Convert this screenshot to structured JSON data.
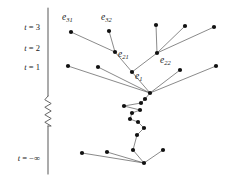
{
  "figure": {
    "background_color": "#ffffff",
    "width": 226,
    "height": 182
  },
  "axis": {
    "name": "time-axis",
    "color": "#666666",
    "x": 48,
    "top_y": 8,
    "bottom_y": 174,
    "break_symbol": "zigzag",
    "break_from_y": 96,
    "break_to_y": 126,
    "ticks": [
      {
        "id": "t3",
        "text": "t = 3",
        "var": "t",
        "rel": "=",
        "value": "3",
        "x": 40,
        "y": 30
      },
      {
        "id": "t2",
        "text": "t = 2",
        "var": "t",
        "rel": "=",
        "value": "2",
        "x": 40,
        "y": 51
      },
      {
        "id": "t1",
        "text": "t = 1",
        "var": "t",
        "rel": "=",
        "value": "1",
        "x": 40,
        "y": 70
      },
      {
        "id": "tneginf",
        "text": "t = -∞",
        "var": "t",
        "rel": "=",
        "value": "−∞",
        "x": 40,
        "y": 161
      }
    ]
  },
  "graph": {
    "type": "tree",
    "node_color": "#111111",
    "edge_color": "#3a3a3a",
    "node_radius": 2.1,
    "nodes": [
      {
        "id": "n_e31",
        "x": 71,
        "y": 32,
        "label": null
      },
      {
        "id": "n_e32",
        "x": 109,
        "y": 31,
        "label": null
      },
      {
        "id": "n_t2a",
        "x": 156,
        "y": 25,
        "label": null
      },
      {
        "id": "n_t2b",
        "x": 185,
        "y": 26,
        "label": null
      },
      {
        "id": "n_t2c",
        "x": 214,
        "y": 27,
        "label": null
      },
      {
        "id": "n_e21",
        "x": 115,
        "y": 52,
        "label": "e21"
      },
      {
        "id": "n_e22",
        "x": 157,
        "y": 53,
        "label": "e22"
      },
      {
        "id": "n_e1",
        "x": 132,
        "y": 72,
        "label": "e1"
      },
      {
        "id": "n_l1",
        "x": 68,
        "y": 66,
        "label": null
      },
      {
        "id": "n_l2",
        "x": 98,
        "y": 67,
        "label": null
      },
      {
        "id": "n_r1",
        "x": 180,
        "y": 70,
        "label": null
      },
      {
        "id": "n_r2",
        "x": 216,
        "y": 66,
        "label": null
      },
      {
        "id": "n_c0",
        "x": 150,
        "y": 93,
        "label": null
      },
      {
        "id": "n_c1",
        "x": 145,
        "y": 99,
        "label": null
      },
      {
        "id": "n_c2",
        "x": 141,
        "y": 103,
        "label": null
      },
      {
        "id": "n_c3",
        "x": 124,
        "y": 106,
        "label": null
      },
      {
        "id": "n_c4",
        "x": 132,
        "y": 113,
        "label": null
      },
      {
        "id": "n_c5",
        "x": 140,
        "y": 110,
        "label": null
      },
      {
        "id": "n_c6",
        "x": 130,
        "y": 119,
        "label": null
      },
      {
        "id": "n_c7",
        "x": 138,
        "y": 122,
        "label": null
      },
      {
        "id": "n_c8",
        "x": 144,
        "y": 128,
        "label": null
      },
      {
        "id": "n_c9",
        "x": 137,
        "y": 135,
        "label": null
      },
      {
        "id": "n_c10",
        "x": 133,
        "y": 150,
        "label": null
      },
      {
        "id": "n_b0",
        "x": 144,
        "y": 163,
        "label": null
      },
      {
        "id": "n_b1",
        "x": 163,
        "y": 150,
        "label": null
      },
      {
        "id": "n_b2",
        "x": 82,
        "y": 153,
        "label": null
      },
      {
        "id": "n_b3",
        "x": 107,
        "y": 152,
        "label": null
      }
    ],
    "edges": [
      {
        "from": "n_e31",
        "to": "n_e21"
      },
      {
        "from": "n_e32",
        "to": "n_e21"
      },
      {
        "from": "n_e21",
        "to": "n_e1"
      },
      {
        "from": "n_t2a",
        "to": "n_e22"
      },
      {
        "from": "n_t2b",
        "to": "n_e22"
      },
      {
        "from": "n_t2c",
        "to": "n_e22"
      },
      {
        "from": "n_e22",
        "to": "n_e1"
      },
      {
        "from": "n_e1",
        "to": "n_c0"
      },
      {
        "from": "n_l1",
        "to": "n_c0"
      },
      {
        "from": "n_l2",
        "to": "n_c0"
      },
      {
        "from": "n_r1",
        "to": "n_c0"
      },
      {
        "from": "n_r2",
        "to": "n_c0"
      },
      {
        "from": "n_c0",
        "to": "n_c1"
      },
      {
        "from": "n_c1",
        "to": "n_c2"
      },
      {
        "from": "n_c2",
        "to": "n_c3"
      },
      {
        "from": "n_c3",
        "to": "n_c5"
      },
      {
        "from": "n_c5",
        "to": "n_c4"
      },
      {
        "from": "n_c4",
        "to": "n_c6"
      },
      {
        "from": "n_c6",
        "to": "n_c7"
      },
      {
        "from": "n_c7",
        "to": "n_c8"
      },
      {
        "from": "n_c8",
        "to": "n_c9"
      },
      {
        "from": "n_c9",
        "to": "n_c10"
      },
      {
        "from": "n_c10",
        "to": "n_b0"
      },
      {
        "from": "n_b1",
        "to": "n_b0"
      },
      {
        "from": "n_b2",
        "to": "n_b0"
      },
      {
        "from": "n_b3",
        "to": "n_b0"
      }
    ],
    "labels": [
      {
        "id": "lbl_e31",
        "base": "e",
        "sub": "31",
        "x": 62,
        "y": 20,
        "anchor": "start"
      },
      {
        "id": "lbl_e32",
        "base": "e",
        "sub": "32",
        "x": 101,
        "y": 20,
        "anchor": "start"
      },
      {
        "id": "lbl_e21",
        "base": "e",
        "sub": "21",
        "x": 118,
        "y": 57,
        "anchor": "start"
      },
      {
        "id": "lbl_e22",
        "base": "e",
        "sub": "22",
        "x": 160,
        "y": 63,
        "anchor": "start"
      },
      {
        "id": "lbl_e1",
        "base": "e",
        "sub": "1",
        "x": 135,
        "y": 79,
        "anchor": "start"
      }
    ]
  }
}
